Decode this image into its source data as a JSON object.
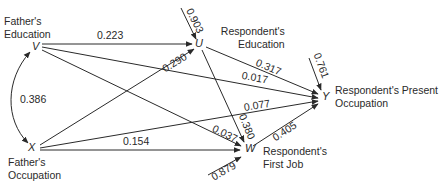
{
  "diagram": {
    "type": "path-diagram",
    "nodes": [
      {
        "id": "V",
        "symbol": "V",
        "label_line1": "Father's",
        "label_line2": "Education"
      },
      {
        "id": "X",
        "symbol": "X",
        "label_line1": "Father's",
        "label_line2": "Occupation"
      },
      {
        "id": "U",
        "symbol": "U",
        "label_line1": "Respondent's",
        "label_line2": "Education"
      },
      {
        "id": "W",
        "symbol": "W",
        "label_line1": "Respondent's",
        "label_line2": "First Job"
      },
      {
        "id": "Y",
        "symbol": "Y",
        "label_line1": "Respondent's Present",
        "label_line2": "Occupation"
      }
    ],
    "edges": [
      {
        "from": "V",
        "to": "U",
        "coef": "0.223"
      },
      {
        "from": "X",
        "to": "U",
        "coef": "0.290"
      },
      {
        "from": "U",
        "to": "Y",
        "coef": "0.317"
      },
      {
        "from": "V",
        "to": "Y",
        "coef": "0.017"
      },
      {
        "from": "X",
        "to": "Y",
        "coef": "0.077"
      },
      {
        "from": "V",
        "to": "W",
        "coef": "0.037"
      },
      {
        "from": "U",
        "to": "W",
        "coef": "0.380"
      },
      {
        "from": "W",
        "to": "Y",
        "coef": "0.405"
      },
      {
        "from": "X",
        "to": "W",
        "coef": "0.154"
      },
      {
        "from": "V",
        "to": "X",
        "coef": "0.386",
        "kind": "correlation"
      },
      {
        "from": "residual",
        "to": "U",
        "coef": "0.903"
      },
      {
        "from": "residual",
        "to": "Y",
        "coef": "0.761"
      },
      {
        "from": "residual",
        "to": "W",
        "coef": "0.879"
      }
    ]
  }
}
